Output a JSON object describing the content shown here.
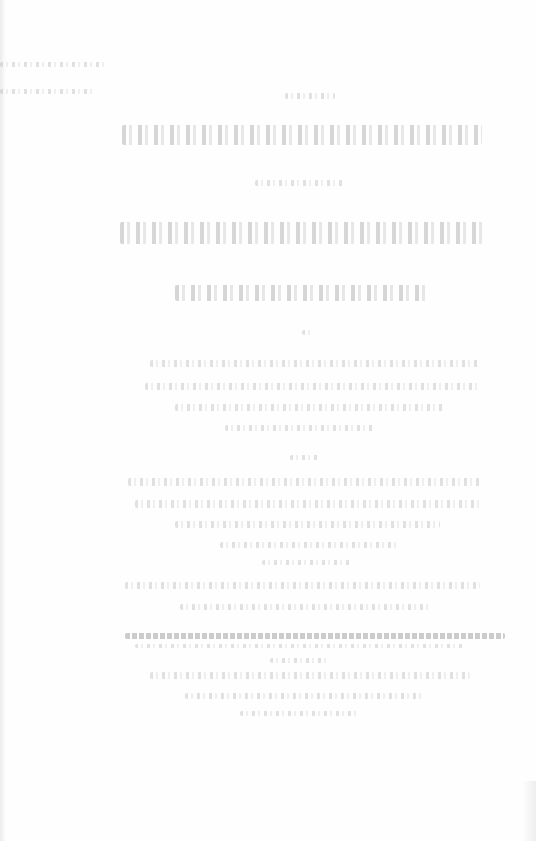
{
  "document": {
    "type": "scanned title page",
    "legibility": "text too faded to read",
    "background": "#fefefe",
    "ink_color": "#9a9a9a"
  },
  "blocks": [
    {
      "name": "corner-note",
      "lines": [
        {
          "x": 0,
          "y": 62,
          "w": 105,
          "h": 5
        },
        {
          "x": 0,
          "y": 89,
          "w": 95,
          "h": 5
        }
      ]
    },
    {
      "name": "title-top",
      "lines": [
        {
          "x": 285,
          "y": 93,
          "w": 50,
          "h": 6
        },
        {
          "x": 122,
          "y": 125,
          "w": 360,
          "h": 20,
          "style": "heavy"
        }
      ]
    },
    {
      "name": "connector",
      "lines": [
        {
          "x": 255,
          "y": 180,
          "w": 90,
          "h": 6
        }
      ]
    },
    {
      "name": "title-main",
      "lines": [
        {
          "x": 120,
          "y": 222,
          "w": 365,
          "h": 22,
          "style": "heavy"
        },
        {
          "x": 175,
          "y": 285,
          "w": 255,
          "h": 16,
          "style": "heavy"
        }
      ]
    },
    {
      "name": "mark",
      "lines": [
        {
          "x": 302,
          "y": 330,
          "w": 12,
          "h": 5
        }
      ]
    },
    {
      "name": "paragraph-1",
      "lines": [
        {
          "x": 150,
          "y": 360,
          "w": 330,
          "h": 7
        },
        {
          "x": 145,
          "y": 383,
          "w": 335,
          "h": 7
        },
        {
          "x": 175,
          "y": 404,
          "w": 270,
          "h": 7
        },
        {
          "x": 225,
          "y": 425,
          "w": 150,
          "h": 6
        }
      ]
    },
    {
      "name": "mark-2",
      "lines": [
        {
          "x": 290,
          "y": 455,
          "w": 30,
          "h": 5
        }
      ]
    },
    {
      "name": "paragraph-2",
      "lines": [
        {
          "x": 128,
          "y": 478,
          "w": 352,
          "h": 8
        },
        {
          "x": 135,
          "y": 500,
          "w": 345,
          "h": 8
        },
        {
          "x": 175,
          "y": 521,
          "w": 265,
          "h": 7
        },
        {
          "x": 220,
          "y": 542,
          "w": 180,
          "h": 6
        },
        {
          "x": 262,
          "y": 560,
          "w": 90,
          "h": 5
        }
      ]
    },
    {
      "name": "paragraph-3",
      "lines": [
        {
          "x": 125,
          "y": 582,
          "w": 355,
          "h": 7
        },
        {
          "x": 180,
          "y": 604,
          "w": 250,
          "h": 6
        }
      ]
    },
    {
      "name": "rule-line",
      "lines": [
        {
          "x": 125,
          "y": 633,
          "w": 380,
          "h": 6,
          "style": "rule"
        },
        {
          "x": 135,
          "y": 644,
          "w": 330,
          "h": 4
        }
      ]
    },
    {
      "name": "paragraph-4",
      "lines": [
        {
          "x": 270,
          "y": 658,
          "w": 60,
          "h": 5
        },
        {
          "x": 150,
          "y": 672,
          "w": 320,
          "h": 7
        },
        {
          "x": 185,
          "y": 693,
          "w": 240,
          "h": 6
        },
        {
          "x": 240,
          "y": 711,
          "w": 120,
          "h": 5
        }
      ]
    }
  ]
}
